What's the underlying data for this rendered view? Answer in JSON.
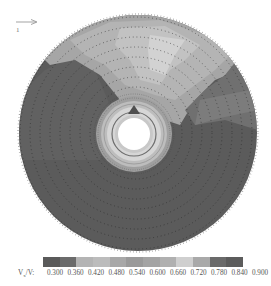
{
  "chart_data": {
    "type": "heatmap",
    "title": "",
    "subtitle": "",
    "colorbar": {
      "label": "Vx/V:",
      "label_main": "V",
      "label_sub": "x",
      "label_rest": "/V:",
      "ticks": [
        "0.300",
        "0.360",
        "0.420",
        "0.480",
        "0.540",
        "0.600",
        "0.660",
        "0.720",
        "0.780",
        "0.840",
        "0.900"
      ],
      "range": [
        0.3,
        0.9
      ],
      "colors": [
        "#5a5a5a",
        "#6b6b6b",
        "#b4b4b4",
        "#bcbcbc",
        "#a8a8a8",
        "#9a9a9a",
        "#a4a4a4",
        "#b0b0b0",
        "#cfcfcf",
        "#a9a9a9",
        "#6a6a6a",
        "#5c5c5c"
      ]
    },
    "annotations": [
      {
        "type": "arrow",
        "direction": "right",
        "label": "1"
      }
    ],
    "disk": {
      "center": [
        137,
        132
      ],
      "radius": 118,
      "hub_radius": 16
    },
    "regions": [
      {
        "zone": "upper wedge (approx. 10–2 o'clock)",
        "value_range": [
          0.72,
          0.84
        ],
        "shade": "light"
      },
      {
        "zone": "near hub ring",
        "value_range": [
          0.66,
          0.84
        ],
        "shade": "light"
      },
      {
        "zone": "left, right and lower disk",
        "value_range": [
          0.3,
          0.42
        ],
        "shade": "dark"
      }
    ],
    "grid": false,
    "legend_position": "bottom"
  },
  "annotation": {
    "direction_label": "1"
  }
}
